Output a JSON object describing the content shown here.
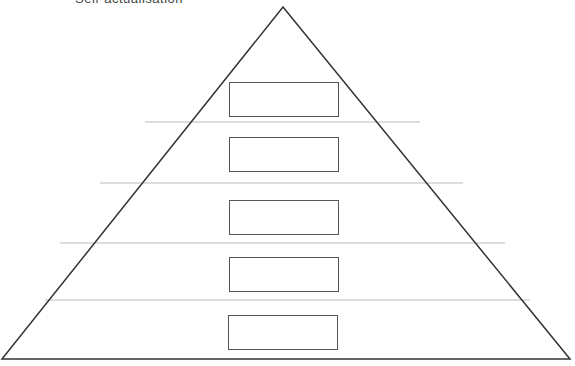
{
  "diagram": {
    "title_cropped": "Self-actualisation",
    "shape": "pyramid",
    "levels": [
      {
        "index": 1,
        "label": "",
        "box": {
          "x": 229,
          "y": 82,
          "w": 110,
          "h": 35
        }
      },
      {
        "index": 2,
        "label": "",
        "box": {
          "x": 229,
          "y": 137,
          "w": 110,
          "h": 35
        }
      },
      {
        "index": 3,
        "label": "",
        "box": {
          "x": 229,
          "y": 200,
          "w": 110,
          "h": 35
        }
      },
      {
        "index": 4,
        "label": "",
        "box": {
          "x": 229,
          "y": 257,
          "w": 110,
          "h": 35
        }
      },
      {
        "index": 5,
        "label": "",
        "box": {
          "x": 228,
          "y": 315,
          "w": 110,
          "h": 35
        }
      }
    ],
    "colors": {
      "outline": "#333333",
      "separator": "#bbbbbb",
      "box_border": "#555555"
    }
  }
}
